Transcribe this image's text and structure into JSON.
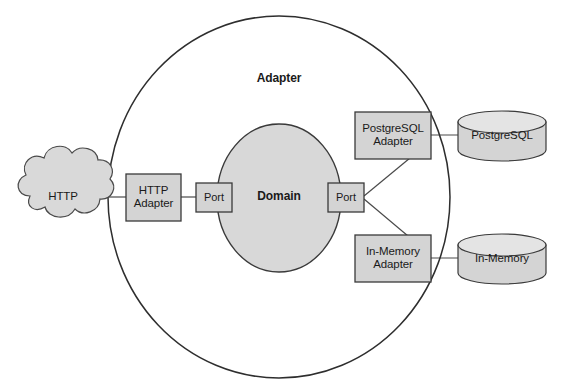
{
  "diagram": {
    "colors": {
      "shape_fill": "#d4d4d4",
      "cloud_fill": "#d9d9d9",
      "core_fill": "#d8d8d8",
      "stroke": "#3a3a3a",
      "ring_stroke": "#2e2e2e",
      "connector": "#4a4a4a",
      "text": "#1a1a1a",
      "background": "#ffffff"
    },
    "ring": {
      "label": "Adapter",
      "shape": "ellipse"
    },
    "core": {
      "label": "Domain",
      "shape": "circle"
    },
    "ports": [
      {
        "id": "port-left",
        "label": "Port"
      },
      {
        "id": "port-right",
        "label": "Port"
      }
    ],
    "external_sources": [
      {
        "id": "http-cloud",
        "label": "HTTP",
        "shape": "cloud"
      }
    ],
    "adapters": [
      {
        "id": "http-adapter",
        "label": "HTTP\nAdapter",
        "shape": "rect"
      },
      {
        "id": "postgresql-adapter",
        "label": "PostgreSQL\nAdapter",
        "shape": "rect"
      },
      {
        "id": "in-memory-adapter",
        "label": "In-Memory\nAdapter",
        "shape": "rect"
      }
    ],
    "datastores": [
      {
        "id": "postgresql-db",
        "label": "PostgreSQL",
        "shape": "cylinder"
      },
      {
        "id": "in-memory-db",
        "label": "In-Memory",
        "shape": "cylinder"
      }
    ],
    "connections": [
      {
        "from": "http-cloud",
        "to": "http-adapter"
      },
      {
        "from": "http-adapter",
        "to": "port-left"
      },
      {
        "from": "port-right",
        "to": "postgresql-adapter"
      },
      {
        "from": "port-right",
        "to": "in-memory-adapter"
      },
      {
        "from": "postgresql-adapter",
        "to": "postgresql-db"
      },
      {
        "from": "in-memory-adapter",
        "to": "in-memory-db"
      }
    ]
  }
}
